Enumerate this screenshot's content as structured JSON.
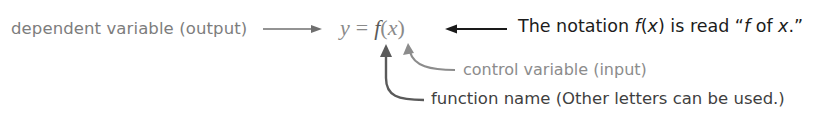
{
  "labels": {
    "dependent": "dependent variable (output)",
    "control": "control variable (input)",
    "function_name": "function name (Other letters can be used.)"
  },
  "equation": {
    "y": "y",
    "equals": "=",
    "f": "f",
    "open": "(",
    "x": "x",
    "close": ")"
  },
  "note": {
    "prefix": "The notation ",
    "f": "f",
    "open": "(",
    "x": "x",
    "close": ")",
    "middle": " is read “",
    "f2": "f",
    "of": " of ",
    "x2": "x",
    "suffix": ".”"
  },
  "colors": {
    "gray_text": "#7d7d7d",
    "dark_text": "#1c1c1c",
    "fn_arrow": "#5a5a5a",
    "input_arrow": "#8c8c8c"
  }
}
